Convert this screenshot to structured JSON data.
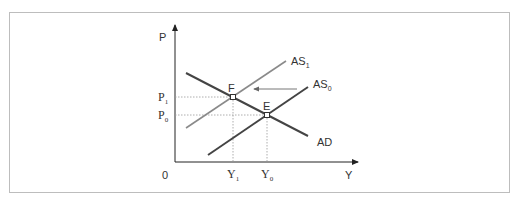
{
  "diagram": {
    "type": "AS-AD shift",
    "axes": {
      "y_label": "P",
      "x_label": "Y",
      "origin_label": "0"
    },
    "curves": [
      {
        "id": "AD",
        "label": "AD",
        "color": "#444444",
        "from": [
          186,
          73
        ],
        "to": [
          308,
          136
        ]
      },
      {
        "id": "AS0",
        "label": "AS",
        "subscript": "0",
        "color": "#444444",
        "from": [
          208,
          155
        ],
        "to": [
          308,
          87
        ]
      },
      {
        "id": "AS1",
        "label": "AS",
        "subscript": "1",
        "color": "#8a8a8a",
        "from": [
          186,
          128
        ],
        "to": [
          286,
          61
        ]
      }
    ],
    "points": [
      {
        "id": "F",
        "label": "F",
        "x": 233,
        "y": 97
      },
      {
        "id": "E",
        "label": "E",
        "x": 267,
        "y": 115
      }
    ],
    "price_levels": [
      {
        "label": "P",
        "subscript": "1",
        "y": 97
      },
      {
        "label": "P",
        "subscript": "0",
        "y": 115
      }
    ],
    "output_levels": [
      {
        "label": "Y",
        "subscript": "1",
        "x": 233
      },
      {
        "label": "Y",
        "subscript": "0",
        "x": 267
      }
    ],
    "shift_arrow": {
      "from": [
        297,
        89
      ],
      "to": [
        252,
        89
      ],
      "meaning": "AS0 shifts left to AS1"
    }
  }
}
